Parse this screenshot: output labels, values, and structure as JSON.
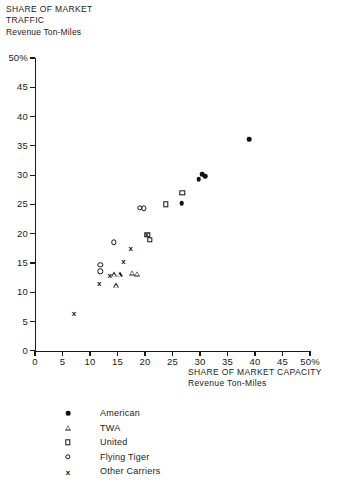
{
  "title": {
    "line1": "SHARE OF MARKET",
    "line2": "TRAFFIC",
    "line3": "Revenue Ton-Miles"
  },
  "xcaption": {
    "line1": "SHARE OF MARKET  CAPACITY",
    "line2": "Revenue Ton-Miles"
  },
  "legend": [
    {
      "key": "american",
      "marker": "filled-circle",
      "label": "American"
    },
    {
      "key": "twa",
      "marker": "triangle",
      "label": "TWA"
    },
    {
      "key": "united",
      "marker": "square",
      "label": "United"
    },
    {
      "key": "flyingtiger",
      "marker": "open-circle",
      "label": "Flying Tiger"
    },
    {
      "key": "other",
      "marker": "x",
      "label": "Other Carriers"
    }
  ],
  "chart_data": {
    "type": "scatter",
    "xlabel": "SHARE OF MARKET CAPACITY  Revenue Ton-Miles",
    "ylabel": "SHARE OF MARKET TRAFFIC  Revenue Ton-Miles",
    "xlim": [
      0,
      50
    ],
    "ylim": [
      0,
      50
    ],
    "xticks": [
      0,
      5,
      10,
      15,
      20,
      25,
      30,
      35,
      40,
      45,
      50
    ],
    "yticks": [
      0,
      5,
      10,
      15,
      20,
      25,
      30,
      35,
      40,
      45,
      50
    ],
    "xticklabels": [
      "0",
      "5",
      "10",
      "15",
      "20",
      "25",
      "30",
      "35",
      "40",
      "45",
      "50%"
    ],
    "yticklabels": [
      "0",
      "5",
      "10",
      "15",
      "20",
      "25",
      "30",
      "35",
      "40",
      "45",
      "50%"
    ],
    "grid": false,
    "legend_position": "below-axes",
    "series": [
      {
        "name": "American",
        "marker": "filled-circle",
        "color": "#101010",
        "points": [
          [
            26.7,
            25.2
          ],
          [
            29.8,
            29.3
          ],
          [
            30.4,
            30.2
          ],
          [
            30.9,
            29.8
          ],
          [
            38.9,
            36.1
          ]
        ]
      },
      {
        "name": "TWA",
        "marker": "triangle",
        "color": "#101010",
        "points": [
          [
            14.4,
            13.1
          ],
          [
            15.4,
            13.1
          ],
          [
            14.8,
            11.2
          ],
          [
            17.6,
            13.3
          ],
          [
            18.6,
            13.2
          ]
        ]
      },
      {
        "name": "United",
        "marker": "square",
        "color": "#101010",
        "points": [
          [
            20.4,
            19.8
          ],
          [
            20.9,
            19.0
          ],
          [
            23.8,
            25.0
          ],
          [
            26.8,
            27.0
          ]
        ]
      },
      {
        "name": "Flying Tiger",
        "marker": "open-circle",
        "color": "#101010",
        "points": [
          [
            11.9,
            14.7
          ],
          [
            11.9,
            13.6
          ],
          [
            14.3,
            18.5
          ],
          [
            19.1,
            24.4
          ],
          [
            19.8,
            24.3
          ]
        ]
      },
      {
        "name": "Other Carriers",
        "marker": "x",
        "color": "#101010",
        "points": [
          [
            7.1,
            6.5
          ],
          [
            11.7,
            11.5
          ],
          [
            13.6,
            12.9
          ],
          [
            16.1,
            15.3
          ],
          [
            17.4,
            17.5
          ],
          [
            20.3,
            20.0
          ]
        ]
      }
    ]
  }
}
